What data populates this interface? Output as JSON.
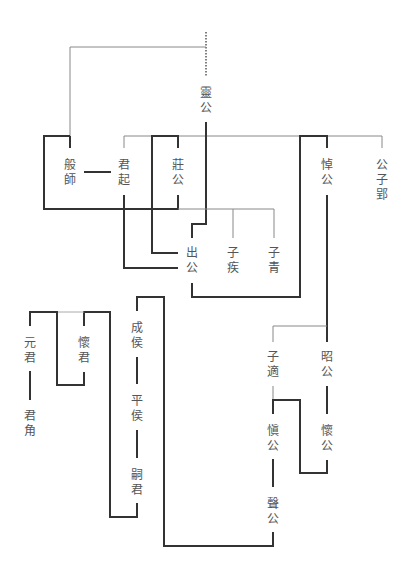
{
  "diagram": {
    "type": "genealogy",
    "line_colors": {
      "thin": "#888888",
      "thick": "#333333"
    },
    "nodes": [
      {
        "id": "linggong",
        "chars": [
          "靈",
          "公"
        ],
        "x": 206,
        "y": 86
      },
      {
        "id": "banshi",
        "chars": [
          "般",
          "師"
        ],
        "x": 70,
        "y": 158
      },
      {
        "id": "junqi",
        "chars": [
          "君",
          "起"
        ],
        "x": 124,
        "y": 158
      },
      {
        "id": "zhuanggong",
        "chars": [
          "莊",
          "公"
        ],
        "x": 178,
        "y": 158
      },
      {
        "id": "daogong",
        "chars": [
          "悼",
          "公"
        ],
        "x": 327,
        "y": 158
      },
      {
        "id": "gongziying",
        "chars": [
          "公",
          "子",
          "郢"
        ],
        "x": 382,
        "y": 158
      },
      {
        "id": "chugong",
        "chars": [
          "出",
          "公"
        ],
        "x": 192,
        "y": 246
      },
      {
        "id": "ziji",
        "chars": [
          "子",
          "疾"
        ],
        "x": 233,
        "y": 246
      },
      {
        "id": "ziqing",
        "chars": [
          "子",
          "青"
        ],
        "x": 274,
        "y": 246
      },
      {
        "id": "yuanjun",
        "chars": [
          "元",
          "君"
        ],
        "x": 30,
        "y": 336
      },
      {
        "id": "huaijun",
        "chars": [
          "懷",
          "君"
        ],
        "x": 84,
        "y": 336
      },
      {
        "id": "junjiao",
        "chars": [
          "君",
          "角"
        ],
        "x": 30,
        "y": 409
      },
      {
        "id": "chenghou",
        "chars": [
          "成",
          "侯"
        ],
        "x": 137,
        "y": 321
      },
      {
        "id": "pinghou",
        "chars": [
          "平",
          "侯"
        ],
        "x": 137,
        "y": 394
      },
      {
        "id": "siju",
        "chars": [
          "嗣",
          "君"
        ],
        "x": 137,
        "y": 468
      },
      {
        "id": "zishi",
        "chars": [
          "子",
          "適"
        ],
        "x": 273,
        "y": 350
      },
      {
        "id": "zhaogong",
        "chars": [
          "昭",
          "公"
        ],
        "x": 327,
        "y": 350
      },
      {
        "id": "shengong",
        "chars": [
          "愼",
          "公"
        ],
        "x": 273,
        "y": 424
      },
      {
        "id": "huaigong",
        "chars": [
          "懷",
          "公"
        ],
        "x": 327,
        "y": 424
      },
      {
        "id": "shenggong",
        "chars": [
          "聲",
          "公"
        ],
        "x": 273,
        "y": 497
      }
    ]
  }
}
